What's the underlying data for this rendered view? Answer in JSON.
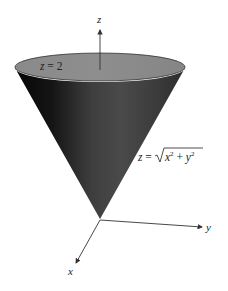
{
  "diagram": {
    "type": "3d-surface-sketch",
    "axes": {
      "x": {
        "label": "x"
      },
      "y": {
        "label": "y"
      },
      "z": {
        "label": "z"
      }
    },
    "labels": {
      "plane": {
        "lhs": "z",
        "eq": " = ",
        "rhs": "2"
      },
      "cone": {
        "lhs": "z",
        "eq": " = ",
        "x": "x",
        "plus": " + ",
        "y": "y",
        "exp": "2"
      }
    },
    "colors": {
      "cap": "#8c8c8c",
      "cone_dark": "#0c0c0c",
      "cone_mid": "#4a4a4a",
      "cone_right": "#333333",
      "axis": "#333333"
    }
  }
}
